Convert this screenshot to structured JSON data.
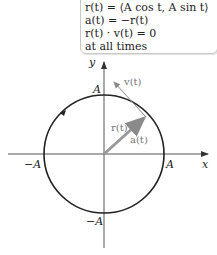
{
  "infobox": {
    "line1": "r(t) = ⟨A cos t, A sin t⟩",
    "line2": "a(t) = −r(t)",
    "line3": "r(t) · v(t) = 0",
    "line4": "at all times"
  },
  "diagram": {
    "axis_x_label": "x",
    "axis_y_label": "y",
    "label_A_top": "A",
    "label_A_right": "A",
    "label_negA_left": "−A",
    "label_negA_bottom": "−A",
    "vector_r_label": "r(t)",
    "vector_a_label": "a(t)",
    "vector_v_label": "v(t)",
    "colors": {
      "circle": "#222222",
      "axes": "#555555",
      "vector": "#9a9a9a"
    }
  }
}
